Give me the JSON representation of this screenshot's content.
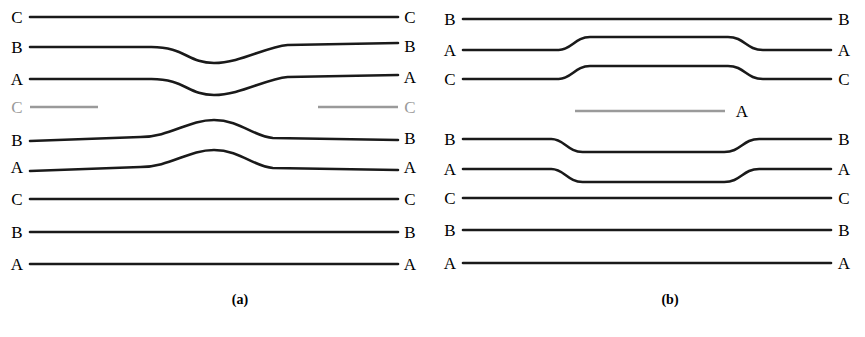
{
  "figure": {
    "background_color": "#ffffff",
    "line_color": "#1a1a1a",
    "gray_line_color": "#9a9a9a",
    "panels": [
      {
        "id": "a",
        "caption": "(a)",
        "rows": [
          {
            "left_label": "C",
            "right_label": "C",
            "y": 17,
            "color": "black",
            "shape": "straight"
          },
          {
            "left_label": "B",
            "right_label": "B",
            "y": 47,
            "color": "black",
            "shape": "dip"
          },
          {
            "left_label": "A",
            "right_label": "A",
            "y": 79,
            "color": "black",
            "shape": "dip"
          },
          {
            "left_label": "C",
            "right_label": "C",
            "y": 107,
            "color": "gray",
            "shape": "broken"
          },
          {
            "left_label": "B",
            "right_label": "B",
            "y": 137,
            "color": "black",
            "shape": "bump"
          },
          {
            "left_label": "A",
            "right_label": "A",
            "y": 167,
            "color": "black",
            "shape": "bump"
          },
          {
            "left_label": "C",
            "right_label": "C",
            "y": 199,
            "color": "black",
            "shape": "straight"
          },
          {
            "left_label": "B",
            "right_label": "B",
            "y": 232,
            "color": "black",
            "shape": "straight"
          },
          {
            "left_label": "A",
            "right_label": "A",
            "y": 264,
            "color": "black",
            "shape": "straight"
          }
        ]
      },
      {
        "id": "b",
        "caption": "(b)",
        "rows": [
          {
            "left_label": "B",
            "right_label": "B",
            "y": 19,
            "color": "black",
            "shape": "straight"
          },
          {
            "left_label": "A",
            "right_label": "A",
            "y": 50,
            "color": "black",
            "shape": "plateau-up"
          },
          {
            "left_label": "C",
            "right_label": "C",
            "y": 79,
            "color": "black",
            "shape": "plateau-up"
          },
          {
            "left_label": "",
            "right_label": "A",
            "y": 111,
            "color": "gray",
            "shape": "gray-centered"
          },
          {
            "left_label": "B",
            "right_label": "B",
            "y": 139,
            "color": "black",
            "shape": "plateau-down"
          },
          {
            "left_label": "A",
            "right_label": "A",
            "y": 169,
            "color": "black",
            "shape": "plateau-down"
          },
          {
            "left_label": "C",
            "right_label": "C",
            "y": 198,
            "color": "black",
            "shape": "straight"
          },
          {
            "left_label": "B",
            "right_label": "B",
            "y": 230,
            "color": "black",
            "shape": "straight"
          },
          {
            "left_label": "A",
            "right_label": "A",
            "y": 263,
            "color": "black",
            "shape": "straight"
          }
        ]
      }
    ],
    "bottom_caption_fragment": "partially cropped caption text"
  }
}
